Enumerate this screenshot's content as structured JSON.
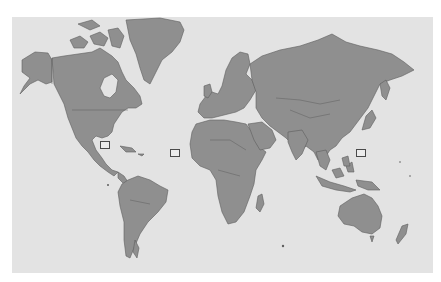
{
  "map": {
    "projection": "mercator",
    "style": "grayscale world political map",
    "colors": {
      "ocean": "#e3e3e3",
      "land": "#8f8f8f",
      "border": "#5e5e5e",
      "marker_fill": "#ececec",
      "marker_border": "#4a4a4a"
    },
    "markers": [
      {
        "id": "marker-gulf-of-mexico",
        "region": "Gulf of Mexico / Caribbean",
        "x": 100,
        "y": 141
      },
      {
        "id": "marker-atlantic",
        "region": "Central Atlantic Ocean",
        "x": 170,
        "y": 149
      },
      {
        "id": "marker-western-pacific",
        "region": "Western Pacific Ocean (east of Philippines)",
        "x": 356,
        "y": 149
      }
    ]
  }
}
